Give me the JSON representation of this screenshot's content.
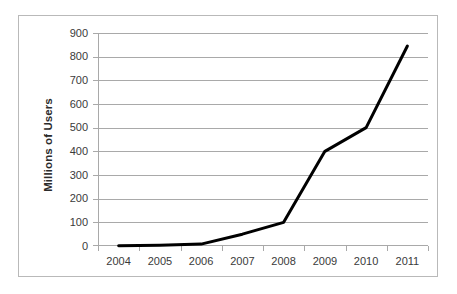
{
  "figure": {
    "background_color": "#ffffff",
    "frame_color": "#b9b9b9",
    "gridline_color": "#a9a9a9",
    "series_color": "#000000",
    "tick_label_color": "#3a3a3a",
    "axis_title_color": "#2b2b2b"
  },
  "axes": {
    "y_title": "Millions of Users",
    "y_ticks": [
      "900",
      "800",
      "700",
      "600",
      "500",
      "400",
      "300",
      "200",
      "100",
      "0"
    ],
    "x_ticks": [
      "2004",
      "2005",
      "2006",
      "2007",
      "2008",
      "2009",
      "2010",
      "2011"
    ]
  },
  "chart_data": {
    "type": "line",
    "title": "",
    "xlabel": "",
    "ylabel": "Millions of Users",
    "categories": [
      "2004",
      "2005",
      "2006",
      "2007",
      "2008",
      "2009",
      "2010",
      "2011"
    ],
    "x": [
      2004,
      2005,
      2006,
      2007,
      2008,
      2009,
      2010,
      2011
    ],
    "values": [
      1,
      3,
      8,
      50,
      100,
      400,
      500,
      845
    ],
    "series": [
      {
        "name": "Millions of Users",
        "values": [
          1,
          3,
          8,
          50,
          100,
          400,
          500,
          845
        ],
        "color": "#000000",
        "line_width": 3,
        "markers": false
      }
    ],
    "ylim": [
      0,
      900
    ],
    "ytick_step": 100,
    "grid": true,
    "grid_axis": "y",
    "legend": false,
    "legend_position": "none"
  }
}
